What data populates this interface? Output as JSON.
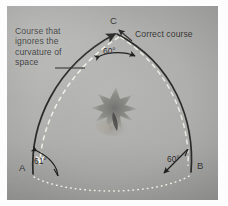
{
  "figure": {
    "kind": "photographed-textbook-diagram",
    "background_color": "#a9a9a7",
    "ink_color": "#2e2e2d",
    "highlight_color": "#f2f0e8"
  },
  "captions": {
    "left": "Course that\nignores the\ncurvature of\nspace",
    "right": "Correct course"
  },
  "vertices": [
    {
      "name": "vertex-C",
      "label": "C",
      "angle": "60°"
    },
    {
      "name": "vertex-A",
      "label": "A",
      "angle": "61°"
    },
    {
      "name": "vertex-B",
      "label": "B",
      "angle": "60°"
    }
  ],
  "vertex_labels": {
    "c": "C",
    "a": "A",
    "b": "B"
  },
  "angles": {
    "c": "60°",
    "a": "61°",
    "b": "60°"
  },
  "paths": {
    "geodesic": "solid dark curved sides A-C-B",
    "flat_course": "white dashed curve inside the triangle",
    "base": "white dotted arc from A to B"
  },
  "center_object": {
    "label": "gravitating mass",
    "description": "blurred dark nebulous blob at center"
  }
}
